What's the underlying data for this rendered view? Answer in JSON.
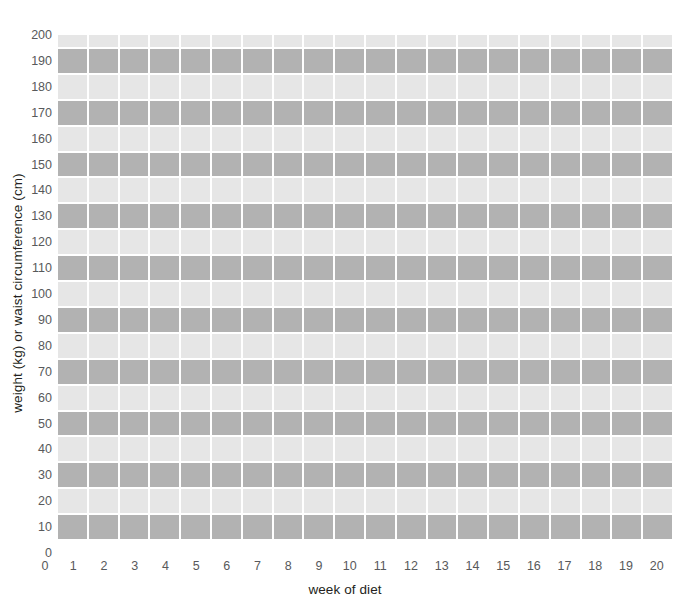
{
  "chart_data": {
    "type": "heatmap",
    "title": "",
    "subtitle": "",
    "xlabel": "week of diet",
    "ylabel": "weight (kg) or waist circumference (cm)",
    "xlim": [
      0,
      20
    ],
    "ylim": [
      0,
      200
    ],
    "grid": true,
    "legend": null,
    "x": [
      0,
      1,
      2,
      3,
      4,
      5,
      6,
      7,
      8,
      9,
      10,
      11,
      12,
      13,
      14,
      15,
      16,
      17,
      18,
      19,
      20
    ],
    "xticklabels": [
      "0",
      "1",
      "2",
      "3",
      "4",
      "5",
      "6",
      "7",
      "8",
      "9",
      "10",
      "11",
      "12",
      "13",
      "14",
      "15",
      "16",
      "17",
      "18",
      "19",
      "20"
    ],
    "y": [
      0,
      10,
      20,
      30,
      40,
      50,
      60,
      70,
      80,
      90,
      100,
      110,
      120,
      130,
      140,
      150,
      160,
      170,
      180,
      190,
      200
    ],
    "yticklabels": [
      "0",
      "10",
      "20",
      "30",
      "40",
      "50",
      "60",
      "70",
      "80",
      "90",
      "100",
      "110",
      "120",
      "130",
      "140",
      "150",
      "160",
      "170",
      "180",
      "190",
      "200"
    ],
    "x_tick_step": 1,
    "y_tick_step": 10,
    "columns": 20,
    "rows": 20,
    "row_bands": [
      {
        "center": 190,
        "range": [
          185,
          195
        ],
        "shade": "dark"
      },
      {
        "center": 180,
        "range": [
          175,
          185
        ],
        "shade": "light"
      },
      {
        "center": 170,
        "range": [
          165,
          175
        ],
        "shade": "dark"
      },
      {
        "center": 160,
        "range": [
          155,
          165
        ],
        "shade": "light"
      },
      {
        "center": 150,
        "range": [
          145,
          155
        ],
        "shade": "dark"
      },
      {
        "center": 140,
        "range": [
          135,
          145
        ],
        "shade": "light"
      },
      {
        "center": 130,
        "range": [
          125,
          135
        ],
        "shade": "dark"
      },
      {
        "center": 120,
        "range": [
          115,
          125
        ],
        "shade": "light"
      },
      {
        "center": 110,
        "range": [
          105,
          115
        ],
        "shade": "dark"
      },
      {
        "center": 100,
        "range": [
          95,
          105
        ],
        "shade": "light"
      },
      {
        "center": 90,
        "range": [
          85,
          95
        ],
        "shade": "dark"
      },
      {
        "center": 80,
        "range": [
          75,
          85
        ],
        "shade": "light"
      },
      {
        "center": 70,
        "range": [
          65,
          75
        ],
        "shade": "dark"
      },
      {
        "center": 60,
        "range": [
          55,
          65
        ],
        "shade": "light"
      },
      {
        "center": 50,
        "range": [
          45,
          55
        ],
        "shade": "dark"
      },
      {
        "center": 40,
        "range": [
          35,
          45
        ],
        "shade": "light"
      },
      {
        "center": 30,
        "range": [
          25,
          35
        ],
        "shade": "dark"
      },
      {
        "center": 20,
        "range": [
          15,
          25
        ],
        "shade": "light"
      },
      {
        "center": 10,
        "range": [
          5,
          15
        ],
        "shade": "dark"
      },
      {
        "center": 200,
        "range": [
          195,
          200
        ],
        "shade": "light"
      }
    ],
    "colors": {
      "band_dark": "#b2b2b2",
      "band_light": "#e6e6e6",
      "gridline": "#ffffff",
      "tick_label": "#58595b",
      "axis_title": "#231f20",
      "background": "#ffffff"
    }
  }
}
